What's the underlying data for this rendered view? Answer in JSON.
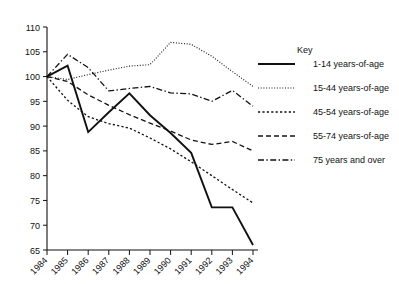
{
  "chart_data": {
    "type": "line",
    "title": "",
    "subtitle": "",
    "xlabel": "",
    "ylabel": "",
    "x": [
      "1984",
      "1985",
      "1986",
      "1987",
      "1988",
      "1989",
      "1990",
      "1991",
      "1992",
      "1993",
      "1994"
    ],
    "xtick_labels": [
      "1984",
      "1985",
      "1986",
      "1987",
      "1988",
      "1989",
      "1990",
      "1991",
      "1992",
      "1993",
      "1994"
    ],
    "ytick_labels": [
      "65",
      "70",
      "75",
      "80",
      "85",
      "90",
      "95",
      "100",
      "105",
      "110"
    ],
    "yticks": [
      65,
      70,
      75,
      80,
      85,
      90,
      95,
      100,
      105,
      110
    ],
    "ylim": [
      65,
      110
    ],
    "grid": false,
    "legend_position": "right",
    "legend_title": "Key",
    "series": [
      {
        "name": "1-14 years-of-age",
        "style": "solid",
        "values": [
          100.0,
          102.2,
          88.8,
          92.8,
          96.6,
          92.2,
          88.6,
          84.6,
          73.6,
          73.6,
          66.0
        ]
      },
      {
        "name": "15-44 years-of-age",
        "style": "dotted",
        "values": [
          100.0,
          99.4,
          100.4,
          101.3,
          102.1,
          102.4,
          106.9,
          106.5,
          104.1,
          101.0,
          98.0
        ]
      },
      {
        "name": "45-54 years-of-age",
        "style": "dashed-fine",
        "values": [
          100.0,
          95.2,
          91.9,
          90.5,
          89.6,
          87.6,
          85.4,
          82.8,
          80.0,
          77.2,
          74.5
        ]
      },
      {
        "name": "55-74 years-of-age",
        "style": "dashed",
        "values": [
          100.0,
          99.0,
          96.3,
          94.2,
          92.3,
          90.6,
          89.0,
          87.2,
          86.3,
          86.9,
          85.0
        ]
      },
      {
        "name": "75 years and over",
        "style": "dash-dot",
        "values": [
          100.0,
          104.5,
          101.8,
          97.1,
          97.6,
          98.0,
          96.7,
          96.5,
          95.0,
          97.2,
          94.0
        ]
      }
    ]
  }
}
